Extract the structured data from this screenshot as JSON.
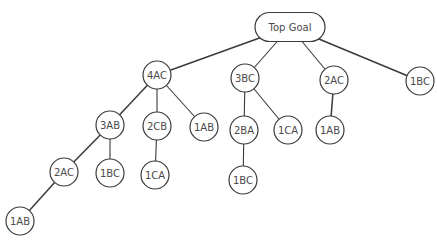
{
  "diagram": {
    "type": "tree",
    "nodes": [
      {
        "id": "top",
        "label": "Top Goal",
        "shape": "pill",
        "x": 290,
        "y": 27,
        "w": 70,
        "h": 29
      },
      {
        "id": "n4AC",
        "label": "4AC",
        "x": 157,
        "y": 75
      },
      {
        "id": "n3BC",
        "label": "3BC",
        "x": 245,
        "y": 78
      },
      {
        "id": "n2AC_a",
        "label": "2AC",
        "x": 334,
        "y": 80
      },
      {
        "id": "n1BC_a",
        "label": "1BC",
        "x": 420,
        "y": 81
      },
      {
        "id": "n3AB",
        "label": "3AB",
        "x": 110,
        "y": 125
      },
      {
        "id": "n2CB",
        "label": "2CB",
        "x": 157,
        "y": 126
      },
      {
        "id": "n1AB_a",
        "label": "1AB",
        "x": 204,
        "y": 127
      },
      {
        "id": "n2BA",
        "label": "2BA",
        "x": 244,
        "y": 130
      },
      {
        "id": "n1CA_a",
        "label": "1CA",
        "x": 288,
        "y": 130
      },
      {
        "id": "n1AB_b",
        "label": "1AB",
        "x": 330,
        "y": 130
      },
      {
        "id": "n2AC_b",
        "label": "2AC",
        "x": 64,
        "y": 172
      },
      {
        "id": "n1BC_b",
        "label": "1BC",
        "x": 110,
        "y": 173
      },
      {
        "id": "n1CA_b",
        "label": "1CA",
        "x": 155,
        "y": 175
      },
      {
        "id": "n1BC_c",
        "label": "1BC",
        "x": 243,
        "y": 180
      },
      {
        "id": "n1AB_c",
        "label": "1AB",
        "x": 20,
        "y": 221
      }
    ],
    "edges": [
      {
        "from": "top",
        "to": "n4AC",
        "thick": true
      },
      {
        "from": "top",
        "to": "n3BC"
      },
      {
        "from": "top",
        "to": "n2AC_a"
      },
      {
        "from": "top",
        "to": "n1BC_a",
        "thick": true
      },
      {
        "from": "n4AC",
        "to": "n3AB",
        "thick": true
      },
      {
        "from": "n4AC",
        "to": "n2CB"
      },
      {
        "from": "n4AC",
        "to": "n1AB_a"
      },
      {
        "from": "n3BC",
        "to": "n2BA"
      },
      {
        "from": "n3BC",
        "to": "n1CA_a"
      },
      {
        "from": "n2AC_a",
        "to": "n1AB_b",
        "thick": true
      },
      {
        "from": "n3AB",
        "to": "n2AC_b",
        "thick": true
      },
      {
        "from": "n3AB",
        "to": "n1BC_b"
      },
      {
        "from": "n2CB",
        "to": "n1CA_b"
      },
      {
        "from": "n2BA",
        "to": "n1BC_c"
      },
      {
        "from": "n2AC_b",
        "to": "n1AB_c",
        "thick": true
      }
    ],
    "node_radius": 14
  },
  "labels": {
    "top": "Top Goal",
    "n4AC": "4AC",
    "n3BC": "3BC",
    "n2AC_a": "2AC",
    "n1BC_a": "1BC",
    "n3AB": "3AB",
    "n2CB": "2CB",
    "n1AB_a": "1AB",
    "n2BA": "2BA",
    "n1CA_a": "1CA",
    "n1AB_b": "1AB",
    "n2AC_b": "2AC",
    "n1BC_b": "1BC",
    "n1CA_b": "1CA",
    "n1BC_c": "1BC",
    "n1AB_c": "1AB"
  }
}
